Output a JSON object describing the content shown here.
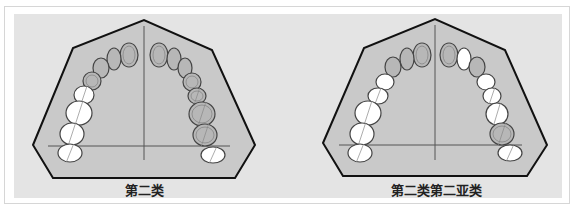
{
  "colors": {
    "page_bg": "#ffffff",
    "panel_bg": "#e4e4e4",
    "palate_fill": "#c9c9c9",
    "outline": "#111111",
    "tooth_shaded": "#b7b7b7",
    "tooth_white": "#ffffff",
    "tooth_stroke": "#444444"
  },
  "diagrams": [
    {
      "caption": "第二类",
      "polygon": "33,145 73,48 144,20 212,50 255,145 235,178 53,178",
      "midline": {
        "x": 144,
        "y1": 26,
        "y2": 160
      },
      "baseline": {
        "y": 146,
        "x1": 48,
        "x2": 230
      },
      "teeth": [
        {
          "cx": 129,
          "cy": 55,
          "rx": 9,
          "ry": 12,
          "shaded": true
        },
        {
          "cx": 159,
          "cy": 55,
          "rx": 9,
          "ry": 12,
          "shaded": true
        },
        {
          "cx": 114,
          "cy": 59,
          "rx": 7,
          "ry": 11,
          "shaded": true
        },
        {
          "cx": 174,
          "cy": 59,
          "rx": 7,
          "ry": 11,
          "shaded": true
        },
        {
          "cx": 101,
          "cy": 68,
          "rx": 8,
          "ry": 10,
          "shaded": true
        },
        {
          "cx": 185,
          "cy": 68,
          "rx": 7,
          "ry": 10,
          "shaded": true
        },
        {
          "cx": 92,
          "cy": 81,
          "rx": 9,
          "ry": 9,
          "shaded": true
        },
        {
          "cx": 192,
          "cy": 82,
          "rx": 9,
          "ry": 9,
          "shaded": true
        },
        {
          "cx": 84,
          "cy": 95,
          "rx": 10,
          "ry": 9,
          "shaded": false
        },
        {
          "cx": 197,
          "cy": 96,
          "rx": 9,
          "ry": 8,
          "shaded": true
        },
        {
          "cx": 79,
          "cy": 113,
          "rx": 13,
          "ry": 12,
          "shaded": false
        },
        {
          "cx": 202,
          "cy": 114,
          "rx": 13,
          "ry": 12,
          "shaded": true
        },
        {
          "cx": 72,
          "cy": 134,
          "rx": 12,
          "ry": 11,
          "shaded": false
        },
        {
          "cx": 205,
          "cy": 135,
          "rx": 12,
          "ry": 11,
          "shaded": true
        },
        {
          "cx": 70,
          "cy": 153,
          "rx": 12,
          "ry": 9,
          "shaded": false
        },
        {
          "cx": 213,
          "cy": 155,
          "rx": 12,
          "ry": 8,
          "shaded": false
        }
      ]
    },
    {
      "caption": "第二类第二亚类",
      "polygon": "323,143 364,48 435,19 505,50 547,145 527,176 343,176",
      "midline": {
        "x": 435,
        "y1": 25,
        "y2": 160
      },
      "baseline": {
        "y": 145,
        "x1": 339,
        "x2": 522
      },
      "teeth": [
        {
          "cx": 422,
          "cy": 55,
          "rx": 9,
          "ry": 12,
          "shaded": true
        },
        {
          "cx": 449,
          "cy": 55,
          "rx": 9,
          "ry": 12,
          "shaded": true
        },
        {
          "cx": 407,
          "cy": 59,
          "rx": 7,
          "ry": 11,
          "shaded": true
        },
        {
          "cx": 464,
          "cy": 59,
          "rx": 7,
          "ry": 11,
          "shaded": false
        },
        {
          "cx": 393,
          "cy": 67,
          "rx": 8,
          "ry": 10,
          "shaded": true
        },
        {
          "cx": 477,
          "cy": 67,
          "rx": 8,
          "ry": 10,
          "shaded": true
        },
        {
          "cx": 385,
          "cy": 82,
          "rx": 9,
          "ry": 8,
          "shaded": false
        },
        {
          "cx": 486,
          "cy": 82,
          "rx": 9,
          "ry": 8,
          "shaded": false
        },
        {
          "cx": 378,
          "cy": 96,
          "rx": 10,
          "ry": 8,
          "shaded": false
        },
        {
          "cx": 492,
          "cy": 96,
          "rx": 9,
          "ry": 8,
          "shaded": false
        },
        {
          "cx": 368,
          "cy": 113,
          "rx": 13,
          "ry": 12,
          "shaded": false
        },
        {
          "cx": 497,
          "cy": 114,
          "rx": 11,
          "ry": 11,
          "shaded": false
        },
        {
          "cx": 362,
          "cy": 134,
          "rx": 12,
          "ry": 11,
          "shaded": false
        },
        {
          "cx": 502,
          "cy": 134,
          "rx": 12,
          "ry": 11,
          "shaded": true
        },
        {
          "cx": 360,
          "cy": 153,
          "rx": 12,
          "ry": 9,
          "shaded": false
        },
        {
          "cx": 510,
          "cy": 153,
          "rx": 12,
          "ry": 8,
          "shaded": false
        }
      ]
    }
  ]
}
